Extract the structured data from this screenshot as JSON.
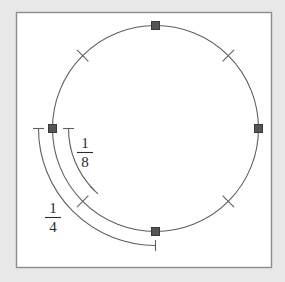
{
  "figure": {
    "canvas": {
      "width": 285,
      "height": 282
    },
    "background_color": "#e8e8e8",
    "panel": {
      "x": 16,
      "y": 12,
      "width": 256,
      "height": 256,
      "fill": "#ffffff",
      "border_color": "#8c8c8c"
    },
    "circle": {
      "cx": 155.5,
      "cy": 128.5,
      "r": 103,
      "stroke_color": "#5f5f5f",
      "stroke_width": 1
    },
    "point_markers": {
      "shape": "square",
      "size": 8,
      "fill": "#555555",
      "stroke": "#333333",
      "points": [
        {
          "name": "top",
          "angle_deg": 90,
          "cx": 155.5,
          "cy": 25.5
        },
        {
          "name": "right",
          "angle_deg": 0,
          "cx": 258.5,
          "cy": 128.5
        },
        {
          "name": "bottom",
          "angle_deg": 270,
          "cx": 155.5,
          "cy": 231.5
        },
        {
          "name": "left",
          "angle_deg": 180,
          "cx": 52.5,
          "cy": 128.5
        }
      ]
    },
    "hash_ticks": {
      "stroke_color": "#5f5f5f",
      "stroke_width": 1,
      "length": 16,
      "angles_deg": [
        45,
        135,
        225,
        315
      ]
    },
    "measure_arcs": [
      {
        "name": "one-eighth-arc",
        "label": "1/8",
        "numerator": "1",
        "denominator": "8",
        "radius": 87,
        "start_angle_deg": 180,
        "end_angle_deg": 225,
        "sweep_fraction": 0.125,
        "stroke_color": "#5f5f5f",
        "label_x": 85,
        "label_y": 152
      },
      {
        "name": "one-quarter-arc",
        "label": "1/4",
        "numerator": "1",
        "denominator": "4",
        "radius": 117,
        "start_angle_deg": 180,
        "end_angle_deg": 270,
        "sweep_fraction": 0.25,
        "stroke_color": "#5f5f5f",
        "label_x": 53,
        "label_y": 217
      }
    ],
    "endcap": {
      "style": "perpendicular-tick",
      "length": 11,
      "stroke_color": "#5f5f5f"
    }
  }
}
